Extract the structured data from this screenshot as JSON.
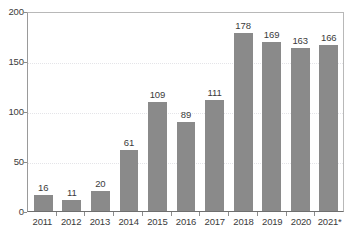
{
  "chart_data": {
    "type": "bar",
    "title": "",
    "subtitle": "",
    "xlabel": "",
    "ylabel": "",
    "categories": [
      "2011",
      "2012",
      "2013",
      "2014",
      "2015",
      "2016",
      "2017",
      "2018",
      "2019",
      "2020",
      "2021*"
    ],
    "values": [
      16,
      11,
      20,
      61,
      109,
      89,
      111,
      178,
      169,
      163,
      166
    ],
    "value_labels": [
      "16",
      "11",
      "20",
      "61",
      "109",
      "89",
      "111",
      "178",
      "169",
      "163",
      "166"
    ],
    "ylim": [
      0,
      200
    ],
    "yticks": [
      0,
      50,
      100,
      150,
      200
    ],
    "ytick_labels": [
      "0",
      "50",
      "100",
      "150",
      "200"
    ],
    "grid": true,
    "grid_axis": "y",
    "legend": "none",
    "bar_color": "#8a8a8a",
    "text_color": "#3b3b3b",
    "gridline_color": "#e4e4e8",
    "axis_color": "#6f6f6f",
    "background": "#ffffff"
  }
}
